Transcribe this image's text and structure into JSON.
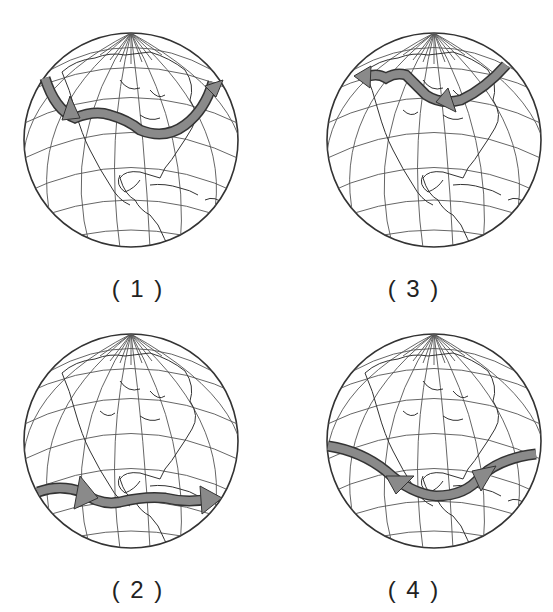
{
  "figure": {
    "panels": [
      {
        "id": "1",
        "label": "( 1 )",
        "arrow_position": "northern",
        "arrow_direction": "west-to-east",
        "note": "arrow loops high over Canada, arrowhead points northeast"
      },
      {
        "id": "3",
        "label": "( 3 )",
        "arrow_position": "northern",
        "arrow_direction": "east-to-west",
        "note": "arrow over Canada pointing west"
      },
      {
        "id": "2",
        "label": "( 2 )",
        "arrow_position": "southern",
        "arrow_direction": "west-to-east",
        "note": "arrow across Central America pointing east"
      },
      {
        "id": "4",
        "label": "( 4 )",
        "arrow_position": "southern",
        "arrow_direction": "east-to-west",
        "note": "arrow dips across Gulf region pointing west"
      }
    ],
    "colors": {
      "arrow_fill": "#8a8a8a",
      "arrow_stroke": "#333333",
      "grid_stroke": "#555555",
      "land_stroke": "#333333",
      "background": "#ffffff"
    }
  }
}
